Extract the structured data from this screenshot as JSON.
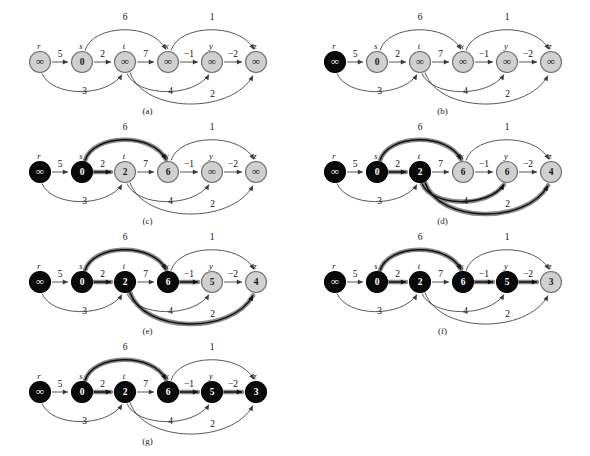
{
  "figure": {
    "panel_count": 7,
    "node_order": [
      "r",
      "s",
      "t",
      "x",
      "y",
      "z"
    ],
    "node_names": {
      "r": "r",
      "s": "s",
      "t": "t",
      "x": "x",
      "y": "y",
      "z": "z"
    },
    "infinity_glyph": "∞",
    "colors": {
      "node_light_fill": "#d0d0d0",
      "node_dark_fill": "#0a0a0a",
      "node_stroke": "#6f6f6f",
      "edge": "#3a3a3a",
      "highlight": "#8a8a8a",
      "text_light": "#1a1a1a",
      "text_dark": "#ffffff",
      "background": "#ffffff"
    },
    "edges": [
      {
        "id": "r-s",
        "from": "r",
        "to": "s",
        "weight": "5",
        "shape": "straight"
      },
      {
        "id": "s-t",
        "from": "s",
        "to": "t",
        "weight": "2",
        "shape": "straight"
      },
      {
        "id": "t-x",
        "from": "t",
        "to": "x",
        "weight": "7",
        "shape": "straight"
      },
      {
        "id": "x-y",
        "from": "x",
        "to": "y",
        "weight": "−1",
        "shape": "straight"
      },
      {
        "id": "y-z",
        "from": "y",
        "to": "z",
        "weight": "−2",
        "shape": "straight"
      },
      {
        "id": "s-x",
        "from": "s",
        "to": "x",
        "weight": "6",
        "shape": "arc-top"
      },
      {
        "id": "x-z",
        "from": "x",
        "to": "z",
        "weight": "1",
        "shape": "arc-top"
      },
      {
        "id": "r-t",
        "from": "r",
        "to": "t",
        "weight": "3",
        "shape": "arc-bottom"
      },
      {
        "id": "t-y",
        "from": "t",
        "to": "y",
        "weight": "4",
        "shape": "arc-bottom"
      },
      {
        "id": "t-z",
        "from": "t",
        "to": "z",
        "weight": "2",
        "shape": "arc-bottom-deep"
      }
    ],
    "panels": [
      {
        "id": "a",
        "caption": "(a)",
        "values": {
          "r": "∞",
          "s": "0",
          "t": "∞",
          "x": "∞",
          "y": "∞",
          "z": "∞"
        },
        "dark": {
          "r": false,
          "s": false,
          "t": false,
          "x": false,
          "y": false,
          "z": false
        },
        "highlighted_edges": []
      },
      {
        "id": "b",
        "caption": "(b)",
        "values": {
          "r": "∞",
          "s": "0",
          "t": "∞",
          "x": "∞",
          "y": "∞",
          "z": "∞"
        },
        "dark": {
          "r": true,
          "s": false,
          "t": false,
          "x": false,
          "y": false,
          "z": false
        },
        "highlighted_edges": []
      },
      {
        "id": "c",
        "caption": "(c)",
        "values": {
          "r": "∞",
          "s": "0",
          "t": "2",
          "x": "6",
          "y": "∞",
          "z": "∞"
        },
        "dark": {
          "r": true,
          "s": true,
          "t": false,
          "x": false,
          "y": false,
          "z": false
        },
        "highlighted_edges": [
          "s-t",
          "s-x"
        ]
      },
      {
        "id": "d",
        "caption": "(d)",
        "values": {
          "r": "∞",
          "s": "0",
          "t": "2",
          "x": "6",
          "y": "6",
          "z": "4"
        },
        "dark": {
          "r": true,
          "s": true,
          "t": true,
          "x": false,
          "y": false,
          "z": false
        },
        "highlighted_edges": [
          "s-t",
          "s-x",
          "t-y",
          "t-z"
        ]
      },
      {
        "id": "e",
        "caption": "(e)",
        "values": {
          "r": "∞",
          "s": "0",
          "t": "2",
          "x": "6",
          "y": "5",
          "z": "4"
        },
        "dark": {
          "r": true,
          "s": true,
          "t": true,
          "x": true,
          "y": false,
          "z": false
        },
        "highlighted_edges": [
          "s-t",
          "s-x",
          "t-z",
          "x-y"
        ]
      },
      {
        "id": "f",
        "caption": "(f)",
        "values": {
          "r": "∞",
          "s": "0",
          "t": "2",
          "x": "6",
          "y": "5",
          "z": "3"
        },
        "dark": {
          "r": true,
          "s": true,
          "t": true,
          "x": true,
          "y": true,
          "z": false
        },
        "highlighted_edges": [
          "s-t",
          "s-x",
          "x-y",
          "y-z"
        ]
      },
      {
        "id": "g",
        "caption": "(g)",
        "values": {
          "r": "∞",
          "s": "0",
          "t": "2",
          "x": "6",
          "y": "5",
          "z": "3"
        },
        "dark": {
          "r": true,
          "s": true,
          "t": true,
          "x": true,
          "y": true,
          "z": true
        },
        "highlighted_edges": [
          "s-t",
          "s-x",
          "x-y",
          "y-z"
        ]
      }
    ]
  }
}
